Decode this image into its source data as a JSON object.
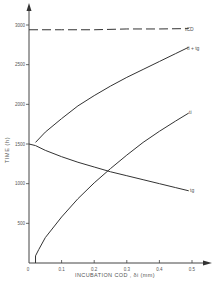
{
  "chart_data": {
    "type": "line",
    "title": "",
    "xlabel": "INCUBATION COD , δi (mm)",
    "ylabel": "TIME (h)",
    "xlim": [
      0,
      0.5
    ],
    "ylim": [
      0,
      3000
    ],
    "x_ticks": [
      "0",
      "0.1",
      "0.2",
      "0.3",
      "0.4",
      "0.5"
    ],
    "y_ticks": [
      "500",
      "1000",
      "1500",
      "2000",
      "2500",
      "3000"
    ],
    "grid": false,
    "legend_position": "inline labels at right end of curves",
    "series": [
      {
        "name": "tCD",
        "style": "dashed",
        "x": [
          0.0,
          0.1,
          0.2,
          0.3,
          0.4,
          0.49
        ],
        "y": [
          2940,
          2940,
          2940,
          2950,
          2950,
          2955
        ]
      },
      {
        "name": "ti + tg",
        "style": "solid",
        "x": [
          0.02,
          0.05,
          0.1,
          0.15,
          0.2,
          0.25,
          0.3,
          0.35,
          0.4,
          0.45,
          0.49
        ],
        "y": [
          1520,
          1650,
          1820,
          1980,
          2110,
          2230,
          2340,
          2440,
          2540,
          2640,
          2720
        ]
      },
      {
        "name": "ti",
        "style": "solid",
        "x": [
          0.02,
          0.02,
          0.03,
          0.05,
          0.1,
          0.15,
          0.2,
          0.25,
          0.3,
          0.35,
          0.4,
          0.45,
          0.49
        ],
        "y": [
          0,
          90,
          170,
          320,
          580,
          810,
          1010,
          1190,
          1360,
          1520,
          1660,
          1790,
          1890
        ]
      },
      {
        "name": "tg",
        "style": "solid",
        "x": [
          0.0,
          0.02,
          0.05,
          0.1,
          0.15,
          0.2,
          0.25,
          0.3,
          0.35,
          0.4,
          0.45,
          0.49
        ],
        "y": [
          1500,
          1480,
          1420,
          1340,
          1270,
          1210,
          1150,
          1100,
          1050,
          1000,
          950,
          910
        ]
      }
    ]
  },
  "labels": {
    "tcd": "tCD",
    "ti_tg": "ti + tg",
    "ti": "ti",
    "tg": "tg"
  }
}
